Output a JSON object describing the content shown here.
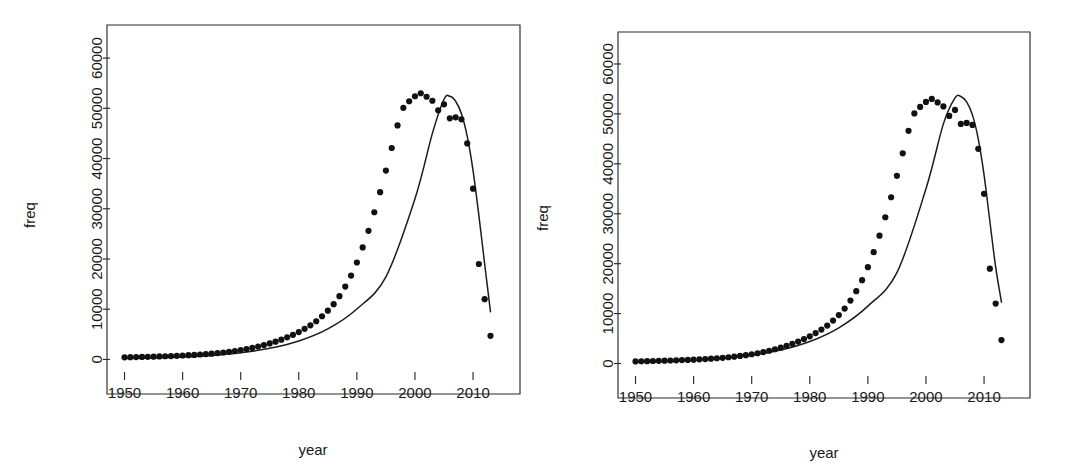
{
  "figure": {
    "panel_count": 2,
    "background_color": "#ffffff",
    "ink_color": "#1a1a1a"
  },
  "chart_data": [
    {
      "type": "scatter",
      "panel": "left",
      "title": "",
      "xlabel": "year",
      "ylabel": "freq",
      "xlim": [
        1947.5,
        2015.5
      ],
      "ylim": [
        -2500,
        63000
      ],
      "xticks": [
        1950,
        1960,
        1970,
        1980,
        1990,
        2000,
        2010
      ],
      "xtick_labels": [
        "1950",
        "1960",
        "1970",
        "1980",
        "1990",
        "2000",
        "2010"
      ],
      "yticks": [
        0,
        10000,
        20000,
        30000,
        40000,
        50000,
        60000
      ],
      "ytick_labels": [
        "0",
        "10000",
        "20000",
        "30000",
        "40000",
        "50000",
        "60000"
      ],
      "grid": false,
      "legend": false,
      "marker_color": "#111111",
      "line_color": "#1c1c1c",
      "x": [
        1950,
        1951,
        1952,
        1953,
        1954,
        1955,
        1956,
        1957,
        1958,
        1959,
        1960,
        1961,
        1962,
        1963,
        1964,
        1965,
        1966,
        1967,
        1968,
        1969,
        1970,
        1971,
        1972,
        1973,
        1974,
        1975,
        1976,
        1977,
        1978,
        1979,
        1980,
        1981,
        1982,
        1983,
        1984,
        1985,
        1986,
        1987,
        1988,
        1989,
        1990,
        1991,
        1992,
        1993,
        1994,
        1995,
        1996,
        1997,
        1998,
        1999,
        2000,
        2001,
        2002,
        2003,
        2004,
        2005,
        2006,
        2007,
        2008,
        2009,
        2010,
        2011,
        2012,
        2013
      ],
      "y": [
        420,
        450,
        470,
        500,
        530,
        560,
        600,
        640,
        680,
        720,
        780,
        840,
        900,
        980,
        1060,
        1150,
        1260,
        1380,
        1520,
        1680,
        1860,
        2060,
        2300,
        2560,
        2860,
        3180,
        3540,
        3940,
        4400,
        4900,
        5450,
        6100,
        6800,
        7600,
        8600,
        9700,
        11000,
        12600,
        14500,
        16700,
        19300,
        22300,
        25600,
        29300,
        33300,
        37600,
        42100,
        46600,
        50100,
        51400,
        52400,
        53000,
        52300,
        51500,
        49600,
        50800,
        48000,
        48200,
        47800,
        43000,
        34000,
        19000,
        12000,
        4700
      ],
      "fit_x": [
        1950,
        1955,
        1960,
        1965,
        1970,
        1975,
        1980,
        1985,
        1990,
        1995,
        2000,
        2003,
        2005,
        2006,
        2007,
        2008,
        2009,
        2010,
        2011,
        2012,
        2013
      ],
      "fit_y": [
        170,
        290,
        480,
        800,
        1330,
        2210,
        3670,
        6080,
        10050,
        16450,
        32000,
        45000,
        51800,
        52400,
        51400,
        48900,
        44400,
        37600,
        28700,
        19000,
        9500
      ],
      "fit_peak_year": 2006,
      "fit_peak_value": 52400,
      "observed_peak_year": 2005,
      "observed_peak_value": 53000,
      "final_point": {
        "x": 2013,
        "y": 4700
      }
    },
    {
      "type": "scatter",
      "panel": "right",
      "title": "",
      "xlabel": "year",
      "ylabel": "freq",
      "xlim": [
        1947.5,
        2015.5
      ],
      "ylim": [
        -2500,
        63000
      ],
      "xticks": [
        1950,
        1960,
        1970,
        1980,
        1990,
        2000,
        2010
      ],
      "xtick_labels": [
        "1950",
        "1960",
        "1970",
        "1980",
        "1990",
        "2000",
        "2010"
      ],
      "yticks": [
        0,
        10000,
        20000,
        30000,
        40000,
        50000,
        60000
      ],
      "ytick_labels": [
        "0",
        "10000",
        "20000",
        "30000",
        "40000",
        "50000",
        "60000"
      ],
      "grid": false,
      "legend": false,
      "marker_color": "#111111",
      "line_color": "#1c1c1c",
      "x": [
        1950,
        1951,
        1952,
        1953,
        1954,
        1955,
        1956,
        1957,
        1958,
        1959,
        1960,
        1961,
        1962,
        1963,
        1964,
        1965,
        1966,
        1967,
        1968,
        1969,
        1970,
        1971,
        1972,
        1973,
        1974,
        1975,
        1976,
        1977,
        1978,
        1979,
        1980,
        1981,
        1982,
        1983,
        1984,
        1985,
        1986,
        1987,
        1988,
        1989,
        1990,
        1991,
        1992,
        1993,
        1994,
        1995,
        1996,
        1997,
        1998,
        1999,
        2000,
        2001,
        2002,
        2003,
        2004,
        2005,
        2006,
        2007,
        2008,
        2009,
        2010,
        2011,
        2012,
        2013
      ],
      "y": [
        420,
        450,
        470,
        500,
        530,
        560,
        600,
        640,
        680,
        720,
        780,
        840,
        900,
        980,
        1060,
        1150,
        1260,
        1380,
        1520,
        1680,
        1860,
        2060,
        2300,
        2560,
        2860,
        3180,
        3540,
        3940,
        4400,
        4900,
        5450,
        6100,
        6800,
        7600,
        8600,
        9700,
        11000,
        12600,
        14500,
        16700,
        19300,
        22300,
        25600,
        29300,
        33300,
        37600,
        42100,
        46600,
        50100,
        51400,
        52400,
        53000,
        52300,
        51500,
        49600,
        50800,
        48000,
        48200,
        47800,
        43000,
        34000,
        19000,
        12000,
        4700
      ],
      "fit_x": [
        1950,
        1955,
        1960,
        1965,
        1970,
        1975,
        1980,
        1985,
        1990,
        1995,
        2000,
        2003,
        2005,
        2006,
        2007,
        2008,
        2009,
        2010,
        2011,
        2012,
        2013
      ],
      "fit_y": [
        230,
        380,
        620,
        1010,
        1650,
        2700,
        4400,
        7150,
        11500,
        18200,
        35000,
        48000,
        53200,
        53500,
        52400,
        49800,
        45000,
        37800,
        28500,
        19300,
        12300
      ],
      "fit_peak_year": 2006,
      "fit_peak_value": 53500,
      "observed_peak_year": 2005,
      "observed_peak_value": 53000,
      "final_point": {
        "x": 2013,
        "y": 4700
      }
    }
  ]
}
